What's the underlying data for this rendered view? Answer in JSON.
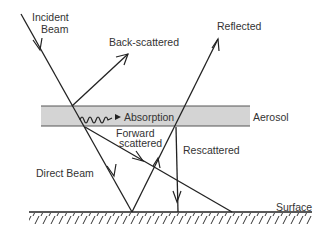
{
  "diagram": {
    "labels": {
      "incident_line1": "Incident",
      "incident_line2": "Beam",
      "back_scattered": "Back-scattered",
      "reflected": "Reflected",
      "absorption": "Absorption",
      "aerosol": "Aerosol",
      "forward_line1": "Forward",
      "forward_line2": "scattered",
      "rescattered": "Rescattered",
      "direct_beam": "Direct Beam",
      "surface": "Surface"
    },
    "colors": {
      "line": "#222222",
      "aerosol_fill": "#d4d4d4",
      "aerosol_border": "#555555",
      "text": "#333333"
    }
  }
}
